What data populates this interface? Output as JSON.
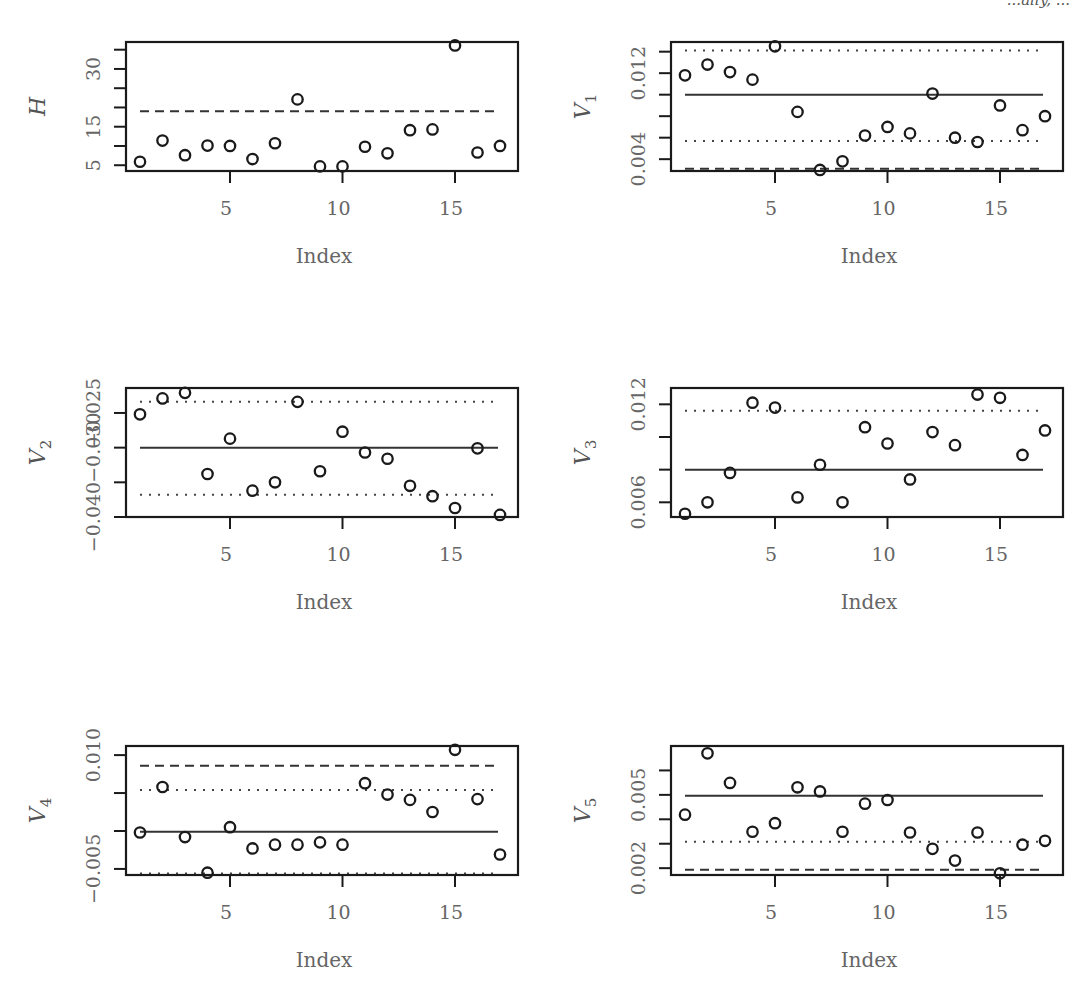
{
  "header": {
    "fragment_text": "...ally, ..."
  },
  "chart_data": [
    {
      "type": "scatter",
      "panel": "H",
      "ylabel": "H",
      "ylabel_sub": "",
      "xlabel": "Index",
      "x": [
        1,
        2,
        3,
        4,
        5,
        6,
        7,
        8,
        9,
        10,
        11,
        12,
        13,
        14,
        15,
        16,
        17
      ],
      "values": [
        5.9,
        11.4,
        7.6,
        10.1,
        10.0,
        6.6,
        10.7,
        22.1,
        4.7,
        4.7,
        9.8,
        8.1,
        14.1,
        14.3,
        36.1,
        8.3,
        10.0
      ],
      "xticks": [
        5,
        10,
        15
      ],
      "yticks": [
        5,
        10,
        15,
        20,
        25,
        30,
        35
      ],
      "ytick_labels": [
        "5",
        "",
        "15",
        "",
        "",
        "30",
        ""
      ],
      "ylim": [
        3.5,
        37.0
      ],
      "hlines": [
        {
          "y": 19.0,
          "style": "dashed"
        }
      ]
    },
    {
      "type": "scatter",
      "panel": "V1",
      "ylabel": "V",
      "ylabel_sub": "1",
      "xlabel": "Index",
      "x": [
        1,
        2,
        3,
        4,
        5,
        6,
        7,
        8,
        9,
        10,
        11,
        12,
        13,
        14,
        15,
        16,
        17
      ],
      "values": [
        0.0118,
        0.0128,
        0.0121,
        0.0114,
        0.0145,
        0.0084,
        0.003,
        0.0038,
        0.0062,
        0.007,
        0.0064,
        0.0101,
        0.006,
        0.0056,
        0.009,
        0.0067,
        0.008
      ],
      "xticks": [
        5,
        10,
        15
      ],
      "yticks": [
        0.004,
        0.006,
        0.008,
        0.01,
        0.012,
        0.014
      ],
      "ytick_labels": [
        "0.004",
        "",
        "",
        "",
        "0.012",
        ""
      ],
      "ylim": [
        0.0029,
        0.0149
      ],
      "hlines": [
        {
          "y": 0.0141,
          "style": "dotted"
        },
        {
          "y": 0.01,
          "style": "solid"
        },
        {
          "y": 0.0057,
          "style": "dotted"
        },
        {
          "y": 0.0031,
          "style": "dashed"
        }
      ]
    },
    {
      "type": "scatter",
      "panel": "V2",
      "ylabel": "V",
      "ylabel_sub": "2",
      "xlabel": "Index",
      "x": [
        1,
        2,
        3,
        4,
        5,
        6,
        7,
        8,
        9,
        10,
        11,
        12,
        13,
        14,
        15,
        16,
        17
      ],
      "values": [
        -0.0252,
        -0.0229,
        -0.0221,
        -0.0338,
        -0.0287,
        -0.0362,
        -0.035,
        -0.0234,
        -0.0334,
        -0.0277,
        -0.0307,
        -0.0316,
        -0.0355,
        -0.037,
        -0.0387,
        -0.0301,
        -0.0397
      ],
      "xticks": [
        5,
        10,
        15
      ],
      "yticks": [
        -0.04,
        -0.035,
        -0.03,
        -0.025
      ],
      "ytick_labels": [
        "−0.040",
        "",
        "−0.030",
        "−0.025"
      ],
      "ylim": [
        -0.04,
        -0.0214
      ],
      "hlines": [
        {
          "y": -0.0234,
          "style": "dotted"
        },
        {
          "y": -0.03,
          "style": "solid"
        },
        {
          "y": -0.0368,
          "style": "dotted"
        }
      ]
    },
    {
      "type": "scatter",
      "panel": "V3",
      "ylabel": "V",
      "ylabel_sub": "3",
      "xlabel": "Index",
      "x": [
        1,
        2,
        3,
        4,
        5,
        6,
        7,
        8,
        9,
        10,
        11,
        12,
        13,
        14,
        15,
        16,
        17
      ],
      "values": [
        0.0053,
        0.006,
        0.0078,
        0.0121,
        0.0118,
        0.0063,
        0.0083,
        0.006,
        0.0106,
        0.0096,
        0.0074,
        0.0103,
        0.0095,
        0.0126,
        0.0124,
        0.0089,
        0.0104
      ],
      "xticks": [
        5,
        10,
        15
      ],
      "yticks": [
        0.006,
        0.008,
        0.01,
        0.012
      ],
      "ytick_labels": [
        "0.006",
        "",
        "",
        "0.012"
      ],
      "ylim": [
        0.0051,
        0.013
      ],
      "hlines": [
        {
          "y": 0.0116,
          "style": "dotted"
        },
        {
          "y": 0.008,
          "style": "solid"
        }
      ]
    },
    {
      "type": "scatter",
      "panel": "V4",
      "ylabel": "V",
      "ylabel_sub": "4",
      "xlabel": "Index",
      "x": [
        1,
        2,
        3,
        4,
        5,
        6,
        7,
        8,
        9,
        10,
        11,
        12,
        13,
        14,
        15,
        16,
        17
      ],
      "values": [
        -0.0002,
        0.0058,
        -0.0008,
        -0.0055,
        0.0005,
        -0.0023,
        -0.0018,
        -0.0018,
        -0.0015,
        -0.0018,
        0.0063,
        0.0048,
        0.0041,
        0.0025,
        0.0107,
        0.0042,
        -0.0031
      ],
      "xticks": [
        5,
        10,
        15
      ],
      "yticks": [
        -0.005,
        0.0,
        0.005,
        0.01
      ],
      "ytick_labels": [
        "−0.005",
        "",
        "",
        "0.010"
      ],
      "ylim": [
        -0.0058,
        0.0112
      ],
      "hlines": [
        {
          "y": 0.0086,
          "style": "dashed"
        },
        {
          "y": 0.0054,
          "style": "dotted"
        },
        {
          "y": -0.0001,
          "style": "solid"
        },
        {
          "y": -0.0056,
          "style": "dotted"
        }
      ]
    },
    {
      "type": "scatter",
      "panel": "V5",
      "ylabel": "V",
      "ylabel_sub": "5",
      "xlabel": "Index",
      "x": [
        1,
        2,
        3,
        4,
        5,
        6,
        7,
        8,
        9,
        10,
        11,
        12,
        13,
        14,
        15,
        16,
        17
      ],
      "values": [
        0.00419,
        0.0067,
        0.00549,
        0.00349,
        0.00384,
        0.00531,
        0.00514,
        0.00349,
        0.00464,
        0.00479,
        0.00346,
        0.00279,
        0.00231,
        0.00346,
        0.00179,
        0.00296,
        0.00312
      ],
      "xticks": [
        5,
        10,
        15
      ],
      "yticks": [
        0.002,
        0.003,
        0.004,
        0.005,
        0.006
      ],
      "ytick_labels": [
        "0.002",
        "",
        "",
        "0.005",
        ""
      ],
      "ylim": [
        0.00172,
        0.007
      ],
      "hlines": [
        {
          "y": 0.00496,
          "style": "solid"
        },
        {
          "y": 0.00308,
          "style": "dotted"
        },
        {
          "y": 0.00193,
          "style": "dashed"
        }
      ]
    }
  ]
}
